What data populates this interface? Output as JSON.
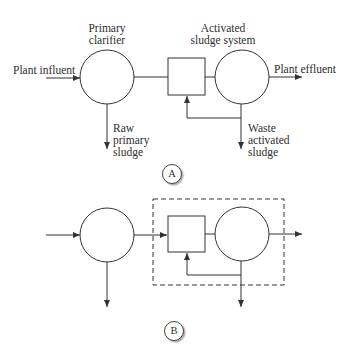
{
  "diagram_a": {
    "tag": "A",
    "labels": {
      "primary_clarifier": [
        "Primary",
        "clarifier"
      ],
      "activated_sludge_system": [
        "Activated",
        "sludge system"
      ],
      "plant_influent": "Plant influent",
      "plant_effluent": "Plant effluent",
      "raw_primary_sludge": [
        "Raw",
        "primary",
        "sludge"
      ],
      "waste_activated_sludge": [
        "Waste",
        "activated",
        "sludge"
      ]
    }
  },
  "diagram_b": {
    "tag": "B"
  },
  "colors": {
    "line": "#333333",
    "background": "#ffffff"
  }
}
